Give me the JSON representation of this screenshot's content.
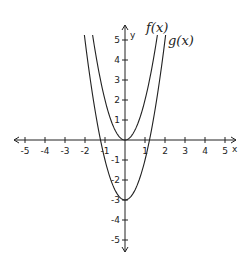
{
  "chart_data": {
    "type": "line",
    "title": "",
    "xlabel": "x",
    "ylabel": "y",
    "xlim": [
      -5,
      5
    ],
    "ylim": [
      -5,
      5
    ],
    "grid": false,
    "x_ticks": [
      -5,
      -4,
      -3,
      -2,
      -1,
      1,
      2,
      3,
      4,
      5
    ],
    "y_ticks": [
      -5,
      -4,
      -3,
      -2,
      -1,
      1,
      2,
      3,
      4,
      5
    ],
    "series": [
      {
        "name": "f(x)",
        "expression": "2x^2",
        "vertex": [
          0,
          0
        ],
        "x": [
          -1.6,
          -1,
          -0.5,
          0,
          0.5,
          1,
          1.6
        ],
        "values": [
          5.12,
          2,
          0.5,
          0,
          0.5,
          2,
          5.12
        ]
      },
      {
        "name": "g(x)",
        "expression": "2x^2 - 3",
        "vertex": [
          0,
          -3
        ],
        "x": [
          -2,
          -1.5,
          -1,
          0,
          1,
          1.5,
          2
        ],
        "values": [
          5,
          1.5,
          -1,
          -3,
          -1,
          1.5,
          5
        ]
      }
    ],
    "annotations": [
      "f(x)",
      "g(x)"
    ]
  },
  "labels": {
    "f": "f(x)",
    "g": "g(x)",
    "x_axis": "x",
    "y_axis": "y"
  },
  "style": {
    "line_color": "#222222",
    "axis_color": "#222222"
  }
}
